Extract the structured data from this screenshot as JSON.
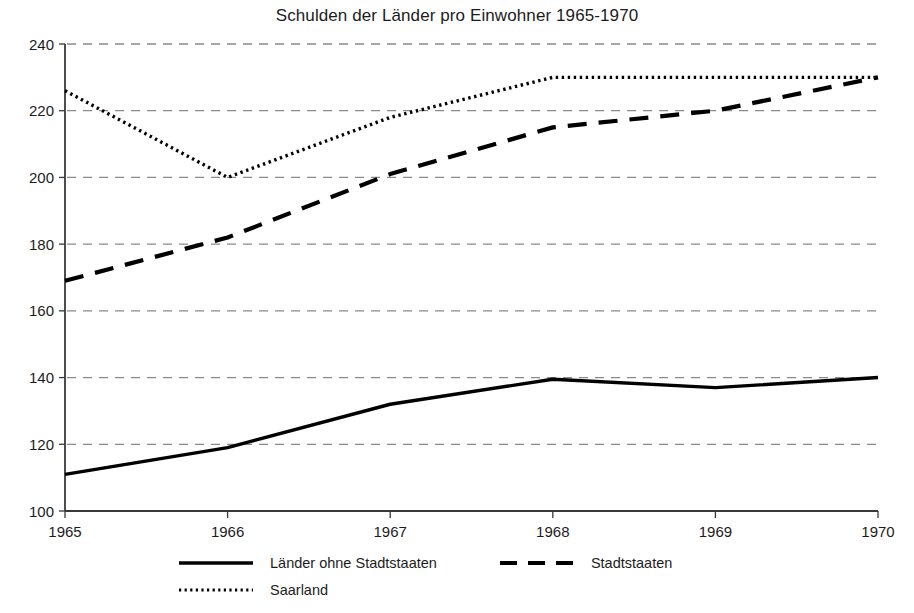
{
  "chart_data": {
    "type": "line",
    "title": "Schulden der Länder pro Einwohner 1965-1970",
    "xlabel": "",
    "ylabel": "",
    "x": [
      1965,
      1966,
      1967,
      1968,
      1969,
      1970
    ],
    "categories": [
      "1965",
      "1966",
      "1967",
      "1968",
      "1969",
      "1970"
    ],
    "xtick_labels": [
      "1965",
      "1966",
      "1967",
      "1968",
      "1969",
      "1970"
    ],
    "ytick_labels": [
      "100",
      "120",
      "140",
      "160",
      "180",
      "200",
      "220",
      "240"
    ],
    "yticks": [
      100,
      120,
      140,
      160,
      180,
      200,
      220,
      240
    ],
    "ylim": [
      100,
      240
    ],
    "xlim": [
      1965,
      1970
    ],
    "grid": "horizontal-dashed",
    "legend_position": "below-plot-left",
    "series": [
      {
        "name": "Länder ohne Stadtstaaten",
        "style": "solid",
        "color": "#000000",
        "values": [
          111,
          119,
          132,
          139.5,
          137,
          140
        ]
      },
      {
        "name": "Stadtstaaten",
        "style": "dashed",
        "color": "#000000",
        "values": [
          169,
          182,
          201,
          215,
          220,
          230
        ]
      },
      {
        "name": "Saarland",
        "style": "dotted",
        "color": "#000000",
        "values": [
          226,
          200,
          218,
          230,
          230,
          230
        ]
      }
    ]
  },
  "title": "Schulden der Länder pro Einwohner 1965-1970",
  "axes": {
    "y_labels": [
      "240",
      "220",
      "200",
      "180",
      "160",
      "140",
      "120",
      "100"
    ],
    "x_labels": [
      "1965",
      "1966",
      "1967",
      "1968",
      "1969",
      "1970"
    ]
  },
  "legend": {
    "row1": {
      "item1_label": "Länder ohne Stadtstaaten",
      "item2_label": "Stadtstaaten"
    },
    "row2": {
      "item1_label": "Saarland"
    }
  },
  "colors": {
    "axis": "#3a3a3a",
    "grid": "#8a8a8a",
    "series": "#000000",
    "text": "#1c1c1c"
  }
}
